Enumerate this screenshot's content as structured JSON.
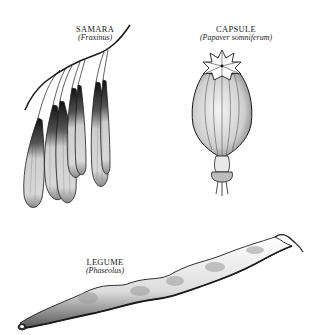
{
  "figure": {
    "background": "#ffffff",
    "ink": "#1a1a1a",
    "fruits": [
      {
        "name": "SAMARA",
        "scientific": "(Fraxinus)"
      },
      {
        "name": "CAPSULE",
        "scientific": "(Papaver somniferum)"
      },
      {
        "name": "LEGUME",
        "scientific": "(Phaseolus)"
      }
    ]
  }
}
